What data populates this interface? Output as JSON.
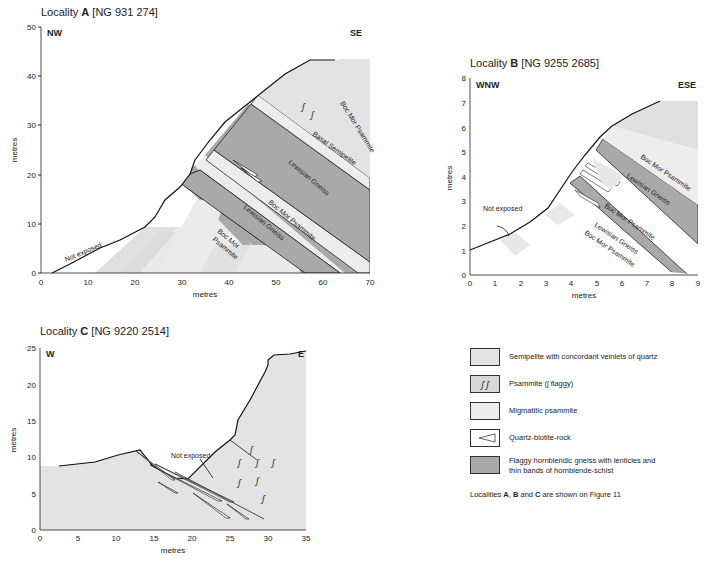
{
  "colors": {
    "semipelite": "#e3e3e3",
    "psammite": "#d9d9d9",
    "migmatitic_psammite": "#ededed",
    "quartz_biotite_rock": "#ffffff",
    "hornblendic_gneiss": "#a8a8a8",
    "outline": "#1a1a1a"
  },
  "locality_a": {
    "title_prefix": "Locality ",
    "title_letter": "A",
    "title_ref": " [NG 931 274]",
    "dir_left": "NW",
    "dir_right": "SE",
    "ylabel": "metres",
    "xlabel": "metres",
    "x_ticks": [
      "0",
      "10",
      "20",
      "30",
      "40",
      "50",
      "60",
      "70"
    ],
    "y_ticks": [
      "0",
      "10",
      "20",
      "30",
      "40",
      "50"
    ],
    "labels": {
      "not_exposed": "Not exposed",
      "boc_mor_top": "Boc Mor Psammite",
      "basal_semipelite": "Basal Semipelite",
      "lewisian_upper": "Lewisian Gneiss",
      "boc_mor_mid": "Boc Mor Psammite",
      "lewisian_lower": "Lewisian Gneiss",
      "boc_mor_low_1": "Boc Mor",
      "boc_mor_low_2": "Psammite"
    }
  },
  "locality_b": {
    "title_prefix": "Locality ",
    "title_letter": "B",
    "title_ref": " [NG 9255  2685]",
    "dir_left": "WNW",
    "dir_right": "ESE",
    "ylabel": "metres",
    "xlabel": "metres",
    "x_ticks": [
      "0",
      "1",
      "2",
      "3",
      "4",
      "5",
      "6",
      "7",
      "8",
      "9"
    ],
    "y_ticks": [
      "0",
      "1",
      "2",
      "3",
      "4",
      "5",
      "6",
      "7",
      "8"
    ],
    "labels": {
      "not_exposed": "Not exposed",
      "boc_mor_top": "Boc Mor Psammite",
      "lewisian_upper": "Lewisian Gneiss",
      "boc_mor_mid": "Boc Mor Psammite",
      "lewisian_lower": "Lewisian Gneiss",
      "boc_mor_low": "Boc Mor Psammite"
    }
  },
  "locality_c": {
    "title_prefix": "Locality ",
    "title_letter": "C",
    "title_ref": " [NG 9220  2514]",
    "dir_left": "W",
    "dir_right": "E",
    "ylabel": "metres",
    "xlabel": "metres",
    "x_ticks": [
      "0",
      "5",
      "10",
      "15",
      "20",
      "25",
      "30",
      "35"
    ],
    "y_ticks": [
      "0",
      "5",
      "10",
      "15",
      "20",
      "25"
    ],
    "labels": {
      "not_exposed": "Not exposed"
    }
  },
  "legend": {
    "items": [
      {
        "key": "semipelite",
        "label": "Semipelite with concordant veinlets of quartz"
      },
      {
        "key": "psammite",
        "label": "Psammite (ʃ flaggy)",
        "symbol": "ʃ ʃ"
      },
      {
        "key": "migmatitic_psammite",
        "label": "Migmatitic psammite"
      },
      {
        "key": "quartz_biotite_rock",
        "label": "Quartz-biotite-rock"
      },
      {
        "key": "hornblendic_gneiss",
        "label_line1": "Flaggy hornblendic gneiss with lenticles and",
        "label_line2": "thin bands of hornblende-schist"
      }
    ],
    "note_prefix": "Localities ",
    "note_a": "A",
    "note_sep1": ", ",
    "note_b": "B",
    "note_and": " and ",
    "note_c": "C",
    "note_suffix": " are shown on Figure 11"
  }
}
